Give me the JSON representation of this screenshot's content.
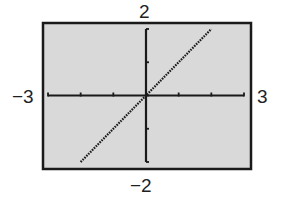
{
  "chart_data": {
    "type": "line",
    "title": "",
    "xlabel": "",
    "ylabel": "",
    "xlim": [
      -3,
      3
    ],
    "ylim": [
      -2,
      2
    ],
    "x_tick_step": 1,
    "y_tick_step": 1,
    "grid": false,
    "legend": null,
    "window_labels": {
      "xmin": "−3",
      "xmax": "3",
      "ymin": "−2",
      "ymax": "2"
    },
    "series": [
      {
        "name": "y = x",
        "style": "dotted",
        "x": [
          -2,
          -1,
          0,
          1,
          2
        ],
        "y": [
          -2,
          -1,
          0,
          1,
          2
        ]
      }
    ]
  },
  "colors": {
    "background": "#d9d9d9",
    "frame": "#1a1a1a",
    "axes": "#1a1a1a",
    "line": "#1a1a1a"
  }
}
